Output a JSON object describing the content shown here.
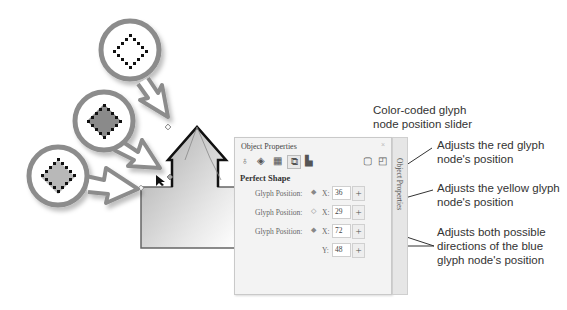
{
  "canvas": {
    "glyph_callouts": [
      {
        "name": "yellow-glyph-node",
        "fill": "#ffffff"
      },
      {
        "name": "blue-glyph-node",
        "fill": "#8a8a8a"
      },
      {
        "name": "red-glyph-node",
        "fill": "#b5b5b5"
      }
    ],
    "shape": "perfect-shape-arrow-house"
  },
  "panel": {
    "title": "Object Properties",
    "close": "× ",
    "toolbar_icons": [
      "outline-pen-icon",
      "fill-icon",
      "transparency-icon",
      "perfect-shape-icon",
      "image-icon",
      "frame-icon",
      "new-page-icon"
    ],
    "section_title": "Perfect Shape",
    "side_tab_label": "Object Properties",
    "rows": [
      {
        "label": "Glyph Position:",
        "node_icon": "◆",
        "node_color": "red",
        "axis": "X:",
        "value": "36",
        "stepper": "+"
      },
      {
        "label": "Glyph Position:",
        "node_icon": "◇",
        "node_color": "yellow",
        "axis": "X:",
        "value": "29",
        "stepper": "+"
      },
      {
        "label": "Glyph Position:",
        "node_icon": "◆",
        "node_color": "blue",
        "axis": "X:",
        "value": "72",
        "stepper": "+"
      },
      {
        "label": "",
        "node_icon": "",
        "node_color": "blue",
        "axis": "Y:",
        "value": "48",
        "stepper": "+"
      }
    ]
  },
  "annotations": {
    "slider": "Color-coded glyph node position slider",
    "red": "Adjusts the red glyph node's position",
    "yellow": "Adjusts the yellow glyph node's position",
    "blue": "Adjusts both possible directions of the blue glyph node's position"
  }
}
